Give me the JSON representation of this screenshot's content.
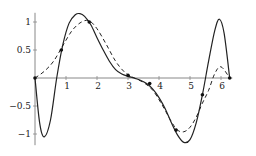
{
  "chart_data": {
    "type": "line",
    "title": "",
    "xlabel": "",
    "ylabel": "",
    "xlim": [
      0,
      6.3
    ],
    "ylim": [
      -1.2,
      1.2
    ],
    "grid": false,
    "legend": null,
    "x_ticks": [
      "1",
      "2",
      "3",
      "4",
      "5",
      "6"
    ],
    "y_ticks": [
      "-1",
      "-0.5",
      "0.5",
      "1"
    ],
    "series": [
      {
        "name": "solid",
        "style": "solid",
        "x": [
          0,
          0.15,
          0.3,
          0.5,
          0.7,
          0.9,
          1.1,
          1.3,
          1.45,
          1.6,
          1.8,
          2.0,
          2.2,
          2.4,
          2.6,
          2.8,
          3.0,
          3.2,
          3.4,
          3.6,
          3.8,
          4.0,
          4.2,
          4.4,
          4.6,
          4.8,
          5.0,
          5.2,
          5.4,
          5.6,
          5.8,
          5.95,
          6.1,
          6.28
        ],
        "y": [
          0,
          -0.8,
          -1.05,
          -0.75,
          0.0,
          0.6,
          0.98,
          1.13,
          1.15,
          1.1,
          0.95,
          0.72,
          0.5,
          0.3,
          0.15,
          0.07,
          0.03,
          0.0,
          -0.04,
          -0.1,
          -0.2,
          -0.35,
          -0.55,
          -0.8,
          -1.02,
          -1.15,
          -1.1,
          -0.8,
          -0.3,
          0.3,
          0.85,
          1.05,
          0.8,
          0.0
        ]
      },
      {
        "name": "dashed",
        "style": "dashed",
        "x": [
          0,
          0.3,
          0.6,
          0.9,
          1.2,
          1.5,
          1.75,
          2.0,
          2.3,
          2.6,
          2.9,
          3.2,
          3.5,
          3.8,
          4.1,
          4.4,
          4.6,
          4.8,
          5.0,
          5.2,
          5.4,
          5.6,
          5.8,
          6.0,
          6.28
        ],
        "y": [
          0,
          0.12,
          0.3,
          0.58,
          0.85,
          1.0,
          1.02,
          0.88,
          0.6,
          0.3,
          0.1,
          0.0,
          -0.08,
          -0.22,
          -0.48,
          -0.78,
          -0.93,
          -0.96,
          -0.88,
          -0.7,
          -0.45,
          -0.22,
          0.08,
          0.2,
          0.0
        ]
      }
    ],
    "points": {
      "x": [
        0,
        0.85,
        1.75,
        3.0,
        3.7,
        4.55,
        5.4,
        6.28
      ],
      "y": [
        0,
        0.5,
        1.0,
        0.05,
        -0.1,
        -0.93,
        -0.3,
        0.0
      ]
    }
  }
}
